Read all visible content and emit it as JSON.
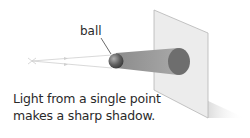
{
  "diagram": {
    "labels": {
      "ball": "ball"
    },
    "caption": {
      "line1": "Light from a single point",
      "line2": "makes a sharp shadow."
    },
    "colors": {
      "screen": "#ececec",
      "screen_edge": "#b5b5b5",
      "shadow_cone": "#9c9c9c",
      "shadow_spot": "#6e6e6e",
      "ball": "#5a5a5a",
      "rays": "#c8c8c8"
    }
  }
}
